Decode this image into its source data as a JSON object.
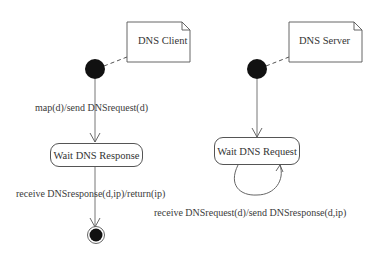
{
  "client": {
    "note_label": "DNS Client",
    "transition_init": "map(d)/send DNSrequest(d)",
    "state_label": "Wait DNS Response",
    "transition_final": "receive DNSresponse(d,ip)/return(ip)"
  },
  "server": {
    "note_label": "DNS Server",
    "state_label": "Wait DNS Request",
    "self_transition": "receive DNSrequest(d)/send DNSresponse(d,ip)"
  }
}
